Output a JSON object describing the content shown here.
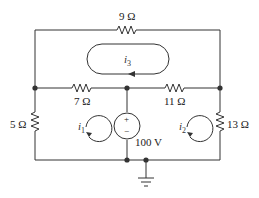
{
  "diagram": {
    "type": "circuit",
    "resistors": {
      "r_top": "9 Ω",
      "r_left_mid": "7 Ω",
      "r_right_mid": "11 Ω",
      "r_left": "5 Ω",
      "r_right": "13 Ω"
    },
    "source": {
      "label": "100 V",
      "plus": "+",
      "minus": "−"
    },
    "mesh_currents": {
      "i1": {
        "sym": "i",
        "sub": "1"
      },
      "i2": {
        "sym": "i",
        "sub": "2"
      },
      "i3": {
        "sym": "i",
        "sub": "3"
      }
    }
  }
}
